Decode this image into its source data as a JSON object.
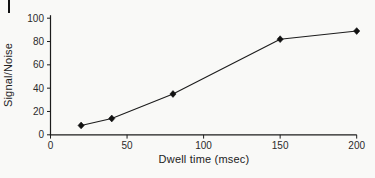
{
  "page": {
    "background": "#f9f9f7",
    "ink": "#1f1f1f",
    "has_page_edge_mark": true
  },
  "chart_data": {
    "type": "line",
    "title": "",
    "xlabel": "Dwell time (msec)",
    "ylabel": "Signal/Noise",
    "x": [
      20,
      40,
      80,
      150,
      200
    ],
    "y": [
      8,
      14,
      35,
      82,
      89
    ],
    "xlim": [
      0,
      200
    ],
    "ylim": [
      0,
      100
    ],
    "xticks": [
      0,
      50,
      100,
      150,
      200
    ],
    "yticks": [
      0,
      20,
      40,
      60,
      80,
      100
    ],
    "grid": false,
    "legend": "none",
    "marker": "diamond",
    "line_color": "#1c1c1c",
    "marker_color": "#111111",
    "tick_label_color": "#2b2b2b"
  }
}
